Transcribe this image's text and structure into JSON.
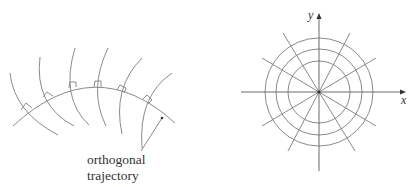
{
  "left_figure": {
    "label_line1": "orthogonal",
    "label_line2": "trajectory",
    "curve_family_count": 6,
    "right_angle_markers": 6
  },
  "right_figure": {
    "x_axis_label": "x",
    "y_axis_label": "y",
    "circle_radii": [
      31,
      43,
      54
    ],
    "radial_line_angles_deg": [
      0,
      30,
      60,
      90,
      120,
      150
    ]
  },
  "colors": {
    "line": "#8a8a8a",
    "axis": "#6a6a6a",
    "text": "#333333"
  }
}
